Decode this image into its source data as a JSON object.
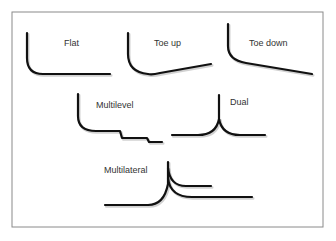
{
  "figure": {
    "frame": {
      "x": 12,
      "y": 12,
      "width": 311,
      "height": 215,
      "border_color": "#8a8a8a"
    },
    "line_color": "#111111",
    "wells": [
      {
        "id": "flat",
        "label": "Flat",
        "label_pos": [
          64,
          46
        ],
        "path": "M27,33 L27,58 Q27,74 43,74 L110,74"
      },
      {
        "id": "toe-up",
        "label": "Toe up",
        "label_pos": [
          154,
          46
        ],
        "path": "M128,33 L128,54 Q128,72 148,74 Q152,75 160,73 L211,64"
      },
      {
        "id": "toe-down",
        "label": "Toe down",
        "label_pos": [
          249,
          46
        ],
        "path": "M228,24 L228,46 Q228,60 246,63 L312,74"
      },
      {
        "id": "multilevel",
        "label": "Multilevel",
        "label_pos": [
          96,
          108
        ],
        "path": "M78,94 L78,116 Q78,131 96,131 L120,131 L122,138 L147,138 L149,142 L162,142"
      },
      {
        "id": "dual",
        "label": "Dual",
        "label_pos": [
          230,
          105
        ],
        "path_trunk": "M219,95 L219,119",
        "path_left": "M219,119 Q216,135 198,135 L172,135",
        "path_right": "M219,119 Q222,135 240,135 L265,135"
      },
      {
        "id": "multilateral",
        "label": "Multilateral",
        "label_pos": [
          104,
          173
        ],
        "path_main": "M105,205 L148,205 Q164,205 168,184 L168,162",
        "path_branch_upper": "M168,168 Q170,186 186,186 L211,186",
        "path_branch_lower": "M168,178 Q170,197 192,197 L252,197"
      }
    ]
  }
}
